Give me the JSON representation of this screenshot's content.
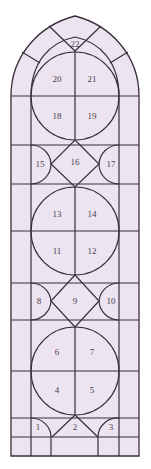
{
  "diagram": {
    "colors": {
      "glass": "#ece4f1",
      "lead": "#3a2f3a",
      "label": "#4a3d4a"
    },
    "panels": [
      {
        "id": "1",
        "x": 38,
        "y": 428
      },
      {
        "id": "2",
        "x": 75,
        "y": 428
      },
      {
        "id": "3",
        "x": 111,
        "y": 428
      },
      {
        "id": "4",
        "x": 57,
        "y": 391
      },
      {
        "id": "5",
        "x": 92,
        "y": 391
      },
      {
        "id": "6",
        "x": 57,
        "y": 353
      },
      {
        "id": "7",
        "x": 92,
        "y": 353
      },
      {
        "id": "8",
        "x": 39,
        "y": 302
      },
      {
        "id": "9",
        "x": 75,
        "y": 302
      },
      {
        "id": "10",
        "x": 111,
        "y": 302
      },
      {
        "id": "11",
        "x": 57,
        "y": 252
      },
      {
        "id": "12",
        "x": 92,
        "y": 252
      },
      {
        "id": "13",
        "x": 57,
        "y": 215
      },
      {
        "id": "14",
        "x": 92,
        "y": 215
      },
      {
        "id": "15",
        "x": 40,
        "y": 165
      },
      {
        "id": "16",
        "x": 75,
        "y": 163
      },
      {
        "id": "17",
        "x": 111,
        "y": 165
      },
      {
        "id": "18",
        "x": 57,
        "y": 117
      },
      {
        "id": "19",
        "x": 92,
        "y": 117
      },
      {
        "id": "20",
        "x": 57,
        "y": 80
      },
      {
        "id": "21",
        "x": 92,
        "y": 80
      },
      {
        "id": "22",
        "x": 75,
        "y": 44
      }
    ]
  }
}
